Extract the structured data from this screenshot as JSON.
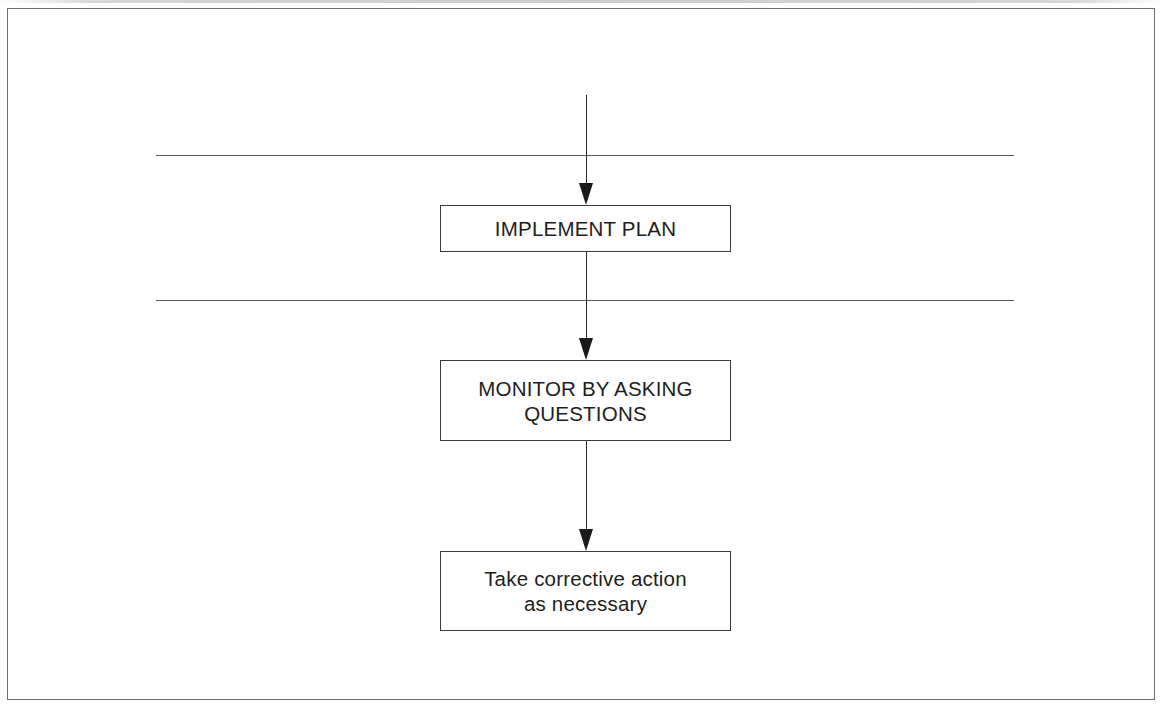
{
  "figure": {
    "type": "flowchart",
    "orientation": "vertical",
    "background_color": "#ffffff",
    "frame": {
      "name": "figure-frame",
      "border_color": "#6e6e6e"
    },
    "separators": [
      {
        "name": "phase-separator-upper",
        "label": ""
      },
      {
        "name": "phase-separator-lower",
        "label": ""
      }
    ],
    "nodes": [
      {
        "id": "implement-plan",
        "label": "IMPLEMENT PLAN",
        "shape": "rectangle",
        "text_case": "uppercase",
        "border_color": "#3a3a3a",
        "fill_color": "#ffffff",
        "text_color": "#1d1d1d"
      },
      {
        "id": "monitor-by-asking-questions",
        "label": "MONITOR BY ASKING\nQUESTIONS",
        "shape": "rectangle",
        "text_case": "uppercase",
        "border_color": "#3a3a3a",
        "fill_color": "#ffffff",
        "text_color": "#1d1d1d"
      },
      {
        "id": "take-corrective-action",
        "label": "Take corrective action\nas necessary",
        "shape": "rectangle",
        "text_case": "sentence",
        "border_color": "#3a3a3a",
        "fill_color": "#ffffff",
        "text_color": "#1d1d1d"
      }
    ],
    "connectors": [
      {
        "id": "entry-arrow",
        "from": "",
        "to": "implement-plan",
        "label": "",
        "style": "solid-arrow-down"
      },
      {
        "id": "plan-to-monitor",
        "from": "implement-plan",
        "to": "monitor-by-asking-questions",
        "label": "",
        "style": "solid-arrow-down"
      },
      {
        "id": "monitor-to-fix",
        "from": "monitor-by-asking-questions",
        "to": "take-corrective-action",
        "label": "",
        "style": "solid-arrow-down"
      }
    ]
  }
}
